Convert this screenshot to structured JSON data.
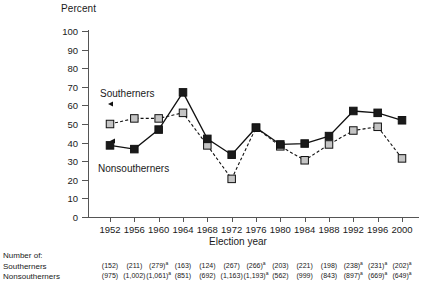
{
  "chart_data": {
    "type": "line",
    "title": "",
    "xlabel": "Election year",
    "ylabel": "Percent",
    "ylim": [
      0,
      100
    ],
    "ytick_step": 10,
    "grid": false,
    "legend_position": "inline-annotations",
    "categories": [
      "1952",
      "1956",
      "1960",
      "1964",
      "1968",
      "1972",
      "1976",
      "1980",
      "1984",
      "1988",
      "1992",
      "1996",
      "2000"
    ],
    "yticks": [
      "100",
      "90",
      "80",
      "70",
      "60",
      "50",
      "40",
      "30",
      "20",
      "10",
      "0"
    ],
    "series": [
      {
        "name": "Southerners",
        "marker": "filled-square",
        "color": "#1a1a1a",
        "line_style": "solid",
        "values": [
          38.5,
          36.5,
          47,
          67,
          42,
          33.5,
          48,
          39,
          39.5,
          43.5,
          57,
          56,
          52
        ]
      },
      {
        "name": "Nonsoutherners",
        "marker": "gray-square",
        "color": "#c4c4c4",
        "line_style": "dashed",
        "values": [
          50,
          53,
          53,
          56,
          38.5,
          20.5,
          48,
          38,
          30.5,
          39,
          46.5,
          48.5,
          31.5
        ]
      }
    ],
    "annotations": [
      {
        "text": "Southerners",
        "points_to": "gray-series"
      },
      {
        "text": "Nonsoutherners",
        "points_to": "black-series"
      }
    ]
  },
  "axis": {
    "y_title": "Percent",
    "x_title": "Election year"
  },
  "labels": {
    "southerners": "Southerners",
    "nonsoutherners": "Nonsoutherners"
  },
  "table": {
    "title": "Number of:",
    "row_labels": [
      "Southerners",
      "Nonsoutherners"
    ],
    "southerners": [
      {
        "value": "(152)",
        "note": ""
      },
      {
        "value": "(211)",
        "note": ""
      },
      {
        "value": "(279)",
        "note": "a"
      },
      {
        "value": "(163)",
        "note": ""
      },
      {
        "value": "(124)",
        "note": ""
      },
      {
        "value": "(267)",
        "note": ""
      },
      {
        "value": "(266)",
        "note": "a"
      },
      {
        "value": "(203)",
        "note": ""
      },
      {
        "value": "(221)",
        "note": ""
      },
      {
        "value": "(198)",
        "note": ""
      },
      {
        "value": "(238)",
        "note": "a"
      },
      {
        "value": "(231)",
        "note": "a"
      },
      {
        "value": "(202)",
        "note": "a"
      }
    ],
    "nonsoutherners": [
      {
        "value": "(975)",
        "note": ""
      },
      {
        "value": "(1,002)",
        "note": ""
      },
      {
        "value": "(1,061)",
        "note": "a"
      },
      {
        "value": "(851)",
        "note": ""
      },
      {
        "value": "(692)",
        "note": ""
      },
      {
        "value": "(1,163)",
        "note": ""
      },
      {
        "value": "(1,193)",
        "note": "a"
      },
      {
        "value": "(562)",
        "note": ""
      },
      {
        "value": "(999)",
        "note": ""
      },
      {
        "value": "(843)",
        "note": ""
      },
      {
        "value": "(897)",
        "note": "a"
      },
      {
        "value": "(669)",
        "note": "a"
      },
      {
        "value": "(649)",
        "note": "a"
      }
    ]
  }
}
